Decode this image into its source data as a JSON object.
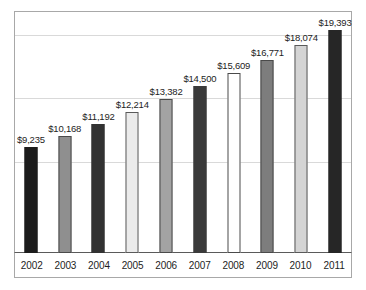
{
  "chart_data": {
    "type": "bar",
    "title": "",
    "subtitle": "",
    "xlabel": "",
    "ylabel": "",
    "categories": [
      "2002",
      "2003",
      "2004",
      "2005",
      "2006",
      "2007",
      "2008",
      "2009",
      "2010",
      "2011"
    ],
    "values": [
      9235,
      11192,
      11192,
      12214,
      13382,
      14500,
      15609,
      16771,
      18074,
      19393
    ],
    "value_labels": [
      "$9,235",
      "$10,168",
      "$11,192",
      "$12,214",
      "$13,382",
      "$14,500",
      "$15,609",
      "$16,771",
      "$18,074",
      "$19,393"
    ],
    "series": [
      {
        "name": "Amount",
        "values": [
          9235,
          10168,
          11192,
          12214,
          13382,
          14500,
          15609,
          16771,
          18074,
          19393
        ]
      }
    ],
    "bars": [
      {
        "category": "2002",
        "value": 9235,
        "label": "$9,235",
        "fill": "#1c1c1c",
        "stroke": "#1c1c1c"
      },
      {
        "category": "2003",
        "value": 10168,
        "label": "$10,168",
        "fill": "#8f8f8f",
        "stroke": "#4a4a4a"
      },
      {
        "category": "2004",
        "value": 11192,
        "label": "$11,192",
        "fill": "#323232",
        "stroke": "#323232"
      },
      {
        "category": "2005",
        "value": 12214,
        "label": "$12,214",
        "fill": "#ebebeb",
        "stroke": "#5a5a5a"
      },
      {
        "category": "2006",
        "value": 13382,
        "label": "$13,382",
        "fill": "#a3a3a3",
        "stroke": "#4a4a4a"
      },
      {
        "category": "2007",
        "value": 14500,
        "label": "$14,500",
        "fill": "#3a3a3a",
        "stroke": "#3a3a3a"
      },
      {
        "category": "2008",
        "value": 15609,
        "label": "$15,609",
        "fill": "#ffffff",
        "stroke": "#4a4a4a"
      },
      {
        "category": "2009",
        "value": 16771,
        "label": "$16,771",
        "fill": "#7d7d7d",
        "stroke": "#4a4a4a"
      },
      {
        "category": "2010",
        "value": 18074,
        "label": "$18,074",
        "fill": "#d4d4d4",
        "stroke": "#5a5a5a"
      },
      {
        "category": "2011",
        "value": 19393,
        "label": "$19,393",
        "fill": "#262626",
        "stroke": "#262626"
      }
    ],
    "ylim": [
      0,
      21000
    ],
    "grid": true,
    "gridline_values": [
      8000,
      13500,
      19000
    ],
    "legend": null,
    "legend_position": "none",
    "axis_tick_labels_y": [],
    "colors": {
      "plot_border": "#a8a8a8",
      "axis_line": "#5a5a5a",
      "gridline": "#d9d9d9",
      "text": "#1d1d1d",
      "background": "#ffffff"
    }
  }
}
